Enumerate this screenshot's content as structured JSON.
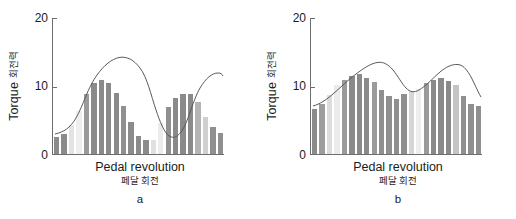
{
  "figure": {
    "background": "#ffffff",
    "axis_color": "#6d6d6d",
    "curve_color": "#5a5a5a"
  },
  "chart_data": [
    {
      "type": "bar",
      "panel": "a",
      "panel_label": "a",
      "title": "",
      "xlabel": "Pedal revolution",
      "xlabel_secondary": "페달 회전",
      "ylabel": "Torque",
      "ylabel_secondary": "회전력",
      "ylim": [
        0,
        20
      ],
      "yticks": [
        0,
        10,
        20
      ],
      "ytick_labels": [
        "0",
        "10",
        "20"
      ],
      "xticks": [],
      "xtick_labels": [],
      "grid": false,
      "legend": false,
      "categories": [
        "1",
        "2",
        "3",
        "4",
        "5",
        "6",
        "7",
        "8",
        "9",
        "10",
        "11",
        "12",
        "13",
        "14",
        "15",
        "16",
        "17",
        "18",
        "19",
        "20",
        "21",
        "22",
        "23",
        "24",
        "25",
        "26",
        "27",
        "28",
        "29",
        "30"
      ],
      "values": [
        2.5,
        3.0,
        4.2,
        6.3,
        8.8,
        10.4,
        10.9,
        10.4,
        8.9,
        7.0,
        4.7,
        2.7,
        2.1,
        2.1,
        4.5,
        6.9,
        8.2,
        8.8,
        8.8,
        7.6,
        5.5,
        4.0,
        3.1
      ],
      "bar_shades": [
        "#8b8b8b",
        "#8b8b8b",
        "#e3e3e3",
        "#eeeeee",
        "#9a9a9a",
        "#8a8a8a",
        "#8a8a8a",
        "#8a8a8a",
        "#8a8a8a",
        "#909090",
        "#8b8b8b",
        "#8b8b8b",
        "#8b8b8b",
        "#e0e0e0",
        "#ececec",
        "#909090",
        "#8a8a8a",
        "#8a8a8a",
        "#8a8a8a",
        "#b4b4b4",
        "#cfcfcf",
        "#8f8f8f",
        "#8f8f8f"
      ],
      "trend_note": "two-peak sinusoidal envelope"
    },
    {
      "type": "bar",
      "panel": "b",
      "panel_label": "b",
      "title": "",
      "xlabel": "Pedal revolution",
      "xlabel_secondary": "페달 회전",
      "ylabel": "Torque",
      "ylabel_secondary": "회전력",
      "ylim": [
        0,
        20
      ],
      "yticks": [
        0,
        10,
        20
      ],
      "ytick_labels": [
        "0",
        "10",
        "20"
      ],
      "xticks": [],
      "xtick_labels": [],
      "grid": false,
      "legend": false,
      "categories": [
        "1",
        "2",
        "3",
        "4",
        "5",
        "6",
        "7",
        "8",
        "9",
        "10",
        "11",
        "12",
        "13",
        "14",
        "15",
        "16",
        "17",
        "18",
        "19",
        "20",
        "21",
        "22",
        "23"
      ],
      "values": [
        6.6,
        7.4,
        8.7,
        10.1,
        10.9,
        11.4,
        11.7,
        11.2,
        10.6,
        9.4,
        8.6,
        8.1,
        8.8,
        9.2,
        9.5,
        10.4,
        10.9,
        11.2,
        10.7,
        10.1,
        8.5,
        7.3,
        7.0
      ],
      "bar_shades": [
        "#8b8b8b",
        "#9d9d9d",
        "#dcdcdc",
        "#ebebeb",
        "#9a9a9a",
        "#8a8a8a",
        "#8a8a8a",
        "#8a8a8a",
        "#9b9b9b",
        "#8f8f8f",
        "#8f8f8f",
        "#8f8f8f",
        "#8f8f8f",
        "#d6d6d6",
        "#ededed",
        "#9a9a9a",
        "#8a8a8a",
        "#8a8a8a",
        "#8a8a8a",
        "#c4c4c4",
        "#909090",
        "#8f8f8f",
        "#8f8f8f"
      ],
      "trend_note": "two broad humps, does not return to baseline"
    }
  ]
}
